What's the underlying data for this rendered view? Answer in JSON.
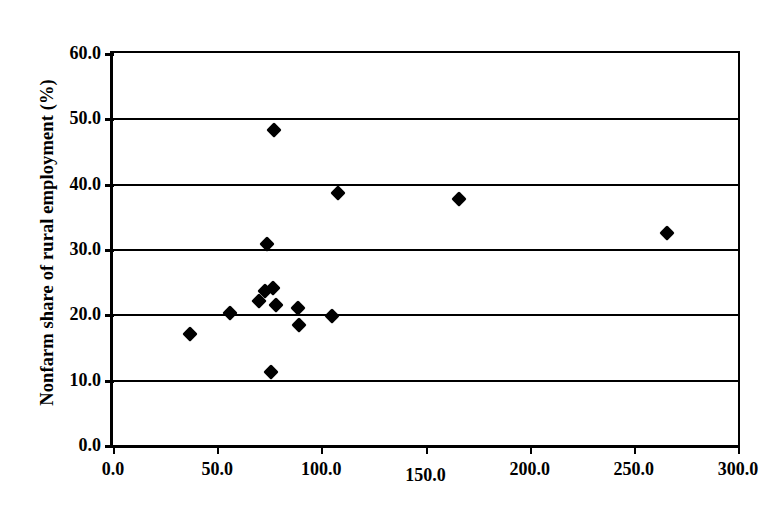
{
  "chart_data": {
    "type": "scatter",
    "title": "",
    "xlabel": "",
    "ylabel": "Nonfarm share of rural employment (%)",
    "xlim": [
      0.0,
      300.0
    ],
    "ylim": [
      0.0,
      60.0
    ],
    "xticks": [
      "0.0",
      "50.0",
      "100.0",
      "150.0",
      "200.0",
      "250.0",
      "300.0"
    ],
    "xtick_values": [
      0,
      50,
      100,
      150,
      200,
      250,
      300
    ],
    "yticks": [
      "0.0",
      "10.0",
      "20.0",
      "30.0",
      "40.0",
      "50.0",
      "60.0"
    ],
    "ytick_values": [
      0,
      10,
      20,
      30,
      40,
      50,
      60
    ],
    "gridlines_y": [
      10,
      20,
      30,
      40,
      50
    ],
    "grid": "horizontal",
    "legend": "none",
    "marker": "filled-diamond",
    "marker_color": "#000000",
    "points": [
      {
        "x": 37.0,
        "y": 17.0
      },
      {
        "x": 56.0,
        "y": 20.2
      },
      {
        "x": 70.0,
        "y": 22.0
      },
      {
        "x": 73.0,
        "y": 23.6
      },
      {
        "x": 74.0,
        "y": 30.7
      },
      {
        "x": 76.0,
        "y": 11.1
      },
      {
        "x": 77.0,
        "y": 24.0
      },
      {
        "x": 77.5,
        "y": 48.2
      },
      {
        "x": 78.0,
        "y": 21.5
      },
      {
        "x": 89.0,
        "y": 21.0
      },
      {
        "x": 89.5,
        "y": 18.3
      },
      {
        "x": 105.0,
        "y": 19.8
      },
      {
        "x": 108.0,
        "y": 38.6
      },
      {
        "x": 166.0,
        "y": 37.7
      },
      {
        "x": 266.0,
        "y": 32.4
      }
    ]
  }
}
